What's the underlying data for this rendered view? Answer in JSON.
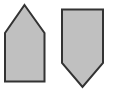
{
  "canvas": {
    "width": 113,
    "height": 90,
    "background_color": "#ffffff"
  },
  "style": {
    "fill_color": "#c0c0c0",
    "stroke_color": "#333333",
    "stroke_width": 2
  },
  "figure": {
    "shape_count": 2
  },
  "shapes": [
    {
      "id": "left-pentagon",
      "name": "pentagon-house-up",
      "orientation": "point-up",
      "vertex_count": 5,
      "points": "24.5,5 44.5,33 44.5,81.5 5,81.5 5,33",
      "fill_color": "#c0c0c0",
      "stroke_color": "#333333",
      "stroke_width": 2,
      "bbox": {
        "x": 5,
        "y": 5,
        "width": 39.5,
        "height": 76.5
      }
    },
    {
      "id": "right-pentagon",
      "name": "pentagon-shield-down",
      "orientation": "point-down",
      "vertex_count": 5,
      "points": "62,9.5 103,9.5 103,63 82.5,87 62,63",
      "fill_color": "#c0c0c0",
      "stroke_color": "#333333",
      "stroke_width": 2,
      "bbox": {
        "x": 62,
        "y": 9.5,
        "width": 41,
        "height": 77.5
      }
    }
  ]
}
